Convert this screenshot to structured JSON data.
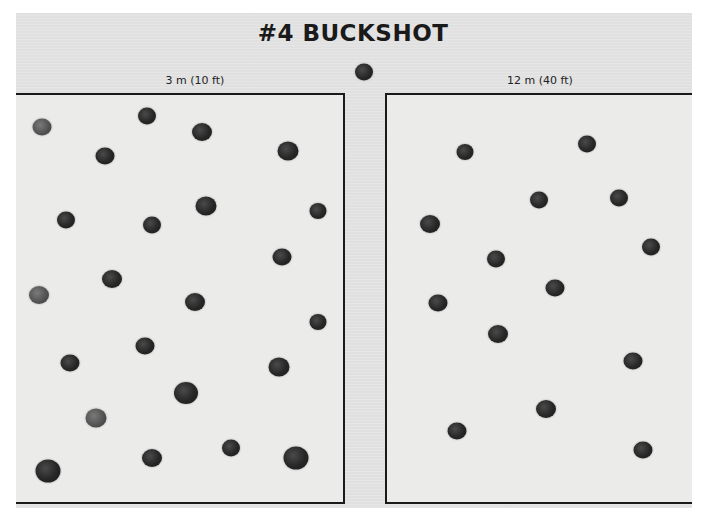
{
  "title": "#4 BUCKSHOT",
  "panels": [
    {
      "id": "left",
      "label": "3 m (10 ft)",
      "pellet_count": 23,
      "pellets": [
        [
          42,
          127,
          19,
          "light"
        ],
        [
          147,
          116,
          18
        ],
        [
          202,
          132,
          20
        ],
        [
          288,
          151,
          21
        ],
        [
          105,
          156,
          19
        ],
        [
          66,
          220,
          18
        ],
        [
          152,
          225,
          18
        ],
        [
          206,
          206,
          21
        ],
        [
          318,
          211,
          17
        ],
        [
          282,
          257,
          19
        ],
        [
          112,
          279,
          20
        ],
        [
          39,
          295,
          20,
          "light"
        ],
        [
          195,
          302,
          20
        ],
        [
          318,
          322,
          17
        ],
        [
          145,
          346,
          19
        ],
        [
          70,
          363,
          19
        ],
        [
          279,
          367,
          21
        ],
        [
          186,
          393,
          24
        ],
        [
          96,
          418,
          21,
          "light"
        ],
        [
          152,
          458,
          20
        ],
        [
          231,
          448,
          18
        ],
        [
          296,
          458,
          25
        ],
        [
          48,
          471,
          25
        ]
      ]
    },
    {
      "id": "right",
      "label": "12 m (40 ft)",
      "pellet_count": 14,
      "pellets": [
        [
          465,
          152,
          17
        ],
        [
          587,
          144,
          18
        ],
        [
          430,
          224,
          20
        ],
        [
          539,
          200,
          18
        ],
        [
          619,
          198,
          18
        ],
        [
          651,
          247,
          18
        ],
        [
          496,
          259,
          18
        ],
        [
          555,
          288,
          19
        ],
        [
          438,
          303,
          19
        ],
        [
          498,
          334,
          20
        ],
        [
          633,
          361,
          19
        ],
        [
          546,
          409,
          20
        ],
        [
          457,
          431,
          19
        ],
        [
          643,
          450,
          19
        ]
      ]
    }
  ],
  "center_pellet": [
    364,
    72,
    18
  ]
}
